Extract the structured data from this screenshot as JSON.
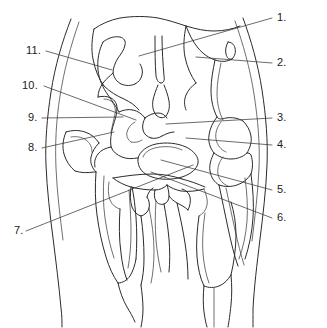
{
  "figure": {
    "kind": "anatomical-line-drawing",
    "region": "pelvis-hip-ventrodorsal-view",
    "background_color": "#ffffff",
    "line_color": "#2b2b2b",
    "leader_color": "#3a3a3a",
    "width": 327,
    "height": 328
  },
  "labels": [
    {
      "id": "1",
      "text": "1.",
      "x": 277,
      "y": 12,
      "side": "right",
      "leader_from": [
        272,
        18
      ],
      "leader_to": [
        139,
        56
      ]
    },
    {
      "id": "2",
      "text": "2.",
      "x": 277,
      "y": 57,
      "side": "right",
      "leader_from": [
        272,
        63
      ],
      "leader_to": [
        196,
        57
      ]
    },
    {
      "id": "3",
      "text": "3.",
      "x": 277,
      "y": 112,
      "side": "right",
      "leader_from": [
        272,
        118
      ],
      "leader_to": [
        166,
        124
      ]
    },
    {
      "id": "4",
      "text": "4.",
      "x": 277,
      "y": 139,
      "side": "right",
      "leader_from": [
        272,
        145
      ],
      "leader_to": [
        186,
        138
      ]
    },
    {
      "id": "5",
      "text": "5.",
      "x": 277,
      "y": 184,
      "side": "right",
      "leader_from": [
        272,
        190
      ],
      "leader_to": [
        161,
        160
      ]
    },
    {
      "id": "6",
      "text": "6.",
      "x": 277,
      "y": 212,
      "side": "right",
      "leader_from": [
        272,
        218
      ],
      "leader_to": [
        151,
        172
      ]
    },
    {
      "id": "7",
      "text": "7.",
      "x": 14,
      "y": 228,
      "side": "left",
      "leader_from": [
        26,
        231
      ],
      "leader_to": [
        193,
        165
      ]
    },
    {
      "id": "8",
      "text": "8.",
      "x": 28,
      "y": 144,
      "side": "left",
      "leader_from": [
        42,
        148
      ],
      "leader_to": [
        114,
        132
      ]
    },
    {
      "id": "9",
      "text": "9.",
      "x": 28,
      "y": 114,
      "side": "left",
      "leader_from": [
        42,
        118
      ],
      "leader_to": [
        123,
        117
      ]
    },
    {
      "id": "10",
      "text": "10.",
      "x": 22,
      "y": 81,
      "side": "left",
      "leader_from": [
        44,
        86
      ],
      "leader_to": [
        136,
        120
      ]
    },
    {
      "id": "11",
      "text": "11.",
      "x": 26,
      "y": 46,
      "side": "left",
      "leader_from": [
        46,
        51
      ],
      "leader_to": [
        112,
        70
      ]
    }
  ],
  "leaders": {
    "count": 11,
    "style": "straight-thin-solid"
  }
}
